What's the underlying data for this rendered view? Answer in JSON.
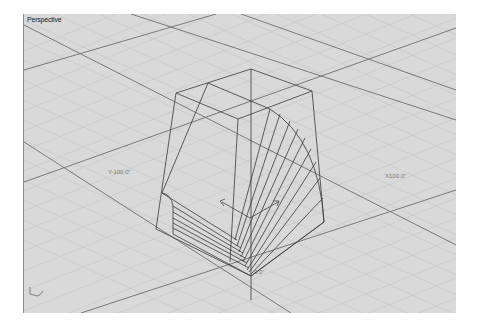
{
  "viewport": {
    "title": "Perspective",
    "background": "#d9d9d9",
    "grid_minor_color": "#c4c4c4",
    "grid_major_color": "#6e6e6e",
    "object_color": "#3a3a3a"
  },
  "axis_labels": {
    "y_negative": "Y-100.0\"",
    "x_positive": "X100.0\"",
    "origin": "0.0\""
  },
  "widgets": {
    "world_axes_icon": "world-axes-icon",
    "gumball_icon": "gumball-icon"
  }
}
